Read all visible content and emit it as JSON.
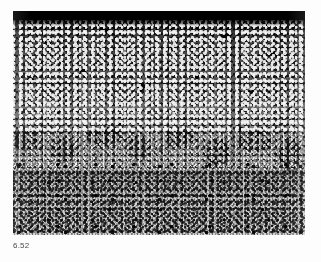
{
  "page": {
    "background_color": "#fdfdfd",
    "width": 321,
    "height": 262
  },
  "figure": {
    "number_label": "6.52",
    "caption_color": "#4a4a4a",
    "plate": {
      "name": "grayscale-micrograph",
      "alt_text": "Grayscale micrograph cross-section showing a solid black surface band at top, a dense coarse dark speckled layer beneath it, grading through an irregular wavy transition into a fine light-gray speckled matrix at the bottom.",
      "x": 13,
      "y": 11,
      "width": 292,
      "height": 224,
      "colors": {
        "top_band": "#000000",
        "dark_zone": "#3a3a3a",
        "mid_zone": "#8e8e8e",
        "light_zone": "#d2d2d2"
      },
      "zones": [
        {
          "name": "solid-black-surface-band",
          "from_y": 0,
          "to_y": 9,
          "tone": "#000000"
        },
        {
          "name": "dense-dark-speckle-zone",
          "from_y": 9,
          "to_y": 118,
          "tone": "#3a3a3a"
        },
        {
          "name": "wavy-transition-zone",
          "from_y": 118,
          "to_y": 172,
          "tone": "#8e8e8e"
        },
        {
          "name": "fine-light-speckle-zone",
          "from_y": 172,
          "to_y": 224,
          "tone": "#d2d2d2"
        }
      ]
    }
  }
}
